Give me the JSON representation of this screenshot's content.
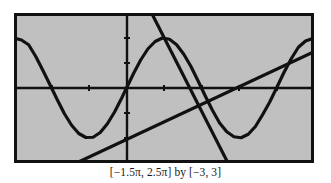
{
  "figure": {
    "caption": "[−1.5π, 2.5π] by [−3, 3]",
    "plot_background_color": "#c0c0c0",
    "frame_color": "#111111",
    "curve_color": "#111111"
  },
  "chart_data": {
    "type": "line",
    "title": "",
    "subtitle": "",
    "xlabel": "",
    "ylabel": "",
    "caption": "[−1.5π, 2.5π] by [−3, 3]",
    "xlim": [
      -4.71238898038469,
      7.853981633974483
    ],
    "ylim": [
      -3,
      3
    ],
    "xlim_label": "[−1.5π, 2.5π]",
    "ylim_label": "[−3, 3]",
    "grid": false,
    "legend": null,
    "axes": {
      "x_axis_at_y": 0,
      "y_axis_at_x": 0,
      "tick_spacing_x": 1.5707963267948966,
      "tick_spacing_y": 1,
      "tick_marks_visible": true
    },
    "series": [
      {
        "name": "clipped sine wave",
        "type": "line",
        "expression": "y = 2 sin(x) clipped to [-2, 2]",
        "x": [
          -4.712389,
          -4.4,
          -4.1,
          -3.8,
          -3.5,
          -3.2,
          -2.9,
          -2.6,
          -2.3,
          -2.0,
          -1.7,
          -1.4,
          -1.1,
          -0.8,
          -0.5,
          -0.2,
          0.0,
          0.3,
          0.6,
          0.9,
          1.2,
          1.5,
          1.8,
          2.1,
          2.4,
          2.7,
          3.0,
          3.3,
          3.6,
          3.9,
          4.2,
          4.5,
          4.8,
          5.1,
          5.4,
          5.7,
          6.0,
          6.3,
          6.6,
          6.9,
          7.2,
          7.5,
          7.853982
        ],
        "y": [
          2.0,
          1.92,
          1.73,
          1.26,
          0.7,
          0.12,
          -0.47,
          -1.03,
          -1.49,
          -1.82,
          -1.98,
          -1.97,
          -1.78,
          -1.43,
          -0.96,
          -0.4,
          0.0,
          0.59,
          1.13,
          1.57,
          1.86,
          2.0,
          1.95,
          1.73,
          1.35,
          0.86,
          0.28,
          -0.32,
          -0.89,
          -1.4,
          -1.75,
          -1.95,
          -1.99,
          -1.85,
          -1.54,
          -1.07,
          -0.56,
          0.03,
          0.63,
          1.17,
          1.63,
          1.88,
          2.0
        ]
      },
      {
        "name": "steep descending line",
        "type": "line",
        "expression": "steep negative-slope line through (π/2+, 0)",
        "x": [
          1.05,
          4.25
        ],
        "y": [
          3.0,
          -3.0
        ]
      },
      {
        "name": "shallow ascending line",
        "type": "line",
        "expression": "shallow positive-slope line through same x-axis crossing",
        "x": [
          -2.1,
          7.853982
        ],
        "y": [
          -3.0,
          1.45
        ]
      }
    ]
  }
}
